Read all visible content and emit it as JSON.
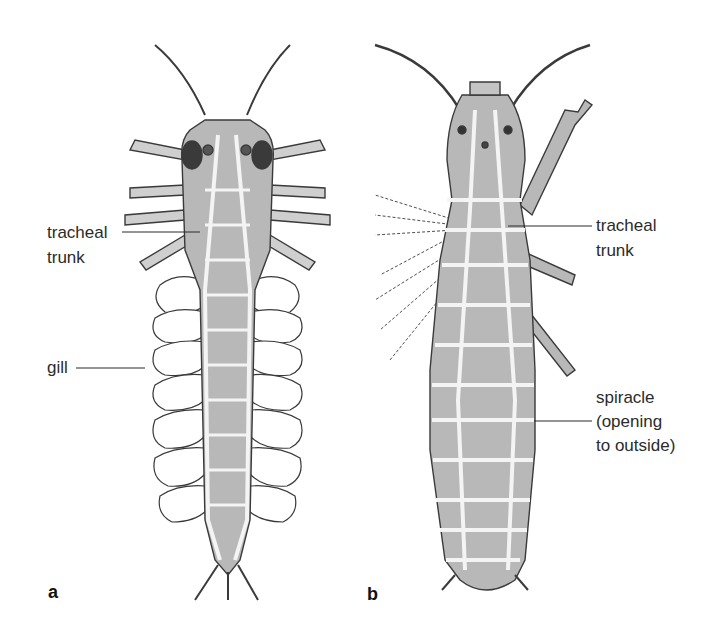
{
  "figure": {
    "panels": [
      {
        "id": "a",
        "letter": "a",
        "subject": "aquatic insect larva (dorsal view) with tracheal gills",
        "labels": {
          "tracheal_trunk_line1": "tracheal",
          "tracheal_trunk_line2": "trunk",
          "gill": "gill"
        }
      },
      {
        "id": "b",
        "letter": "b",
        "subject": "terrestrial insect (dorsal view) with spiracles",
        "labels": {
          "tracheal_trunk_line1": "tracheal",
          "tracheal_trunk_line2": "trunk",
          "spiracle_line1": "spiracle",
          "spiracle_line2": "(opening",
          "spiracle_line3": "to outside)"
        }
      }
    ],
    "colors": {
      "body_fill": "#b8b8b8",
      "outline": "#3a3a3a",
      "trachea": "#f4f4f4",
      "text": "#2b2b2b",
      "background": "#ffffff"
    }
  }
}
